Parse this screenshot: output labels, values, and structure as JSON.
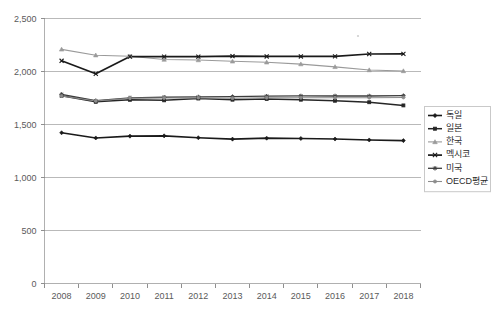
{
  "chart_data": {
    "type": "line",
    "title": "",
    "xlabel": "",
    "ylabel": "",
    "categories": [
      "2008",
      "2009",
      "2010",
      "2011",
      "2012",
      "2013",
      "2014",
      "2015",
      "2016",
      "2017",
      "2018"
    ],
    "ylim": [
      0,
      2500
    ],
    "yticks": [
      0,
      500,
      1000,
      1500,
      2000,
      2500
    ],
    "ytick_labels": [
      "0",
      "500",
      "1,000",
      "1,500",
      "2,000",
      "2,500"
    ],
    "grid": true,
    "legend_position": "right",
    "series": [
      {
        "name": "독일",
        "marker": "diamond",
        "color": "#1a1a1a",
        "values": [
          1422,
          1373,
          1390,
          1393,
          1375,
          1362,
          1371,
          1368,
          1363,
          1354,
          1348
        ]
      },
      {
        "name": "일본",
        "marker": "square",
        "color": "#262626",
        "values": [
          1771,
          1714,
          1733,
          1728,
          1745,
          1734,
          1741,
          1734,
          1724,
          1710,
          1680
        ]
      },
      {
        "name": "한국",
        "marker": "triangle",
        "color": "#9a9a9a",
        "values": [
          2209,
          2154,
          2144,
          2113,
          2108,
          2096,
          2087,
          2070,
          2044,
          2014,
          2005
        ]
      },
      {
        "name": "멕시코",
        "marker": "cross",
        "color": "#1a1a1a",
        "values": [
          2101,
          1979,
          2141,
          2140,
          2140,
          2145,
          2142,
          2142,
          2143,
          2165,
          2166
        ]
      },
      {
        "name": "미국",
        "marker": "asterisk",
        "color": "#3d3d3d",
        "values": [
          1785,
          1724,
          1752,
          1757,
          1760,
          1763,
          1768,
          1770,
          1769,
          1769,
          1772
        ]
      },
      {
        "name": "OECD평균",
        "marker": "circle",
        "color": "#8c8c8c",
        "values": [
          1769,
          1722,
          1748,
          1750,
          1753,
          1748,
          1753,
          1753,
          1752,
          1753,
          1755
        ]
      }
    ]
  },
  "legend": {
    "items": [
      "독일",
      "일본",
      "한국",
      "멕시코",
      "미국",
      "OECD평균"
    ]
  }
}
